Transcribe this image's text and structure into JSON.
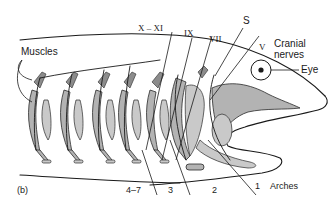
{
  "figure": {
    "panel_label": "(b)",
    "labels": {
      "muscles": "Muscles",
      "cranial_nerves_line1": "Cranial",
      "cranial_nerves_line2": "nerves",
      "eye": "Eye",
      "arches": "Arches"
    },
    "nerves": [
      {
        "id": "X-XI",
        "label": "X – XI"
      },
      {
        "id": "IX",
        "label": "IX"
      },
      {
        "id": "VII",
        "label": "VII"
      },
      {
        "id": "S",
        "label": "S"
      },
      {
        "id": "V",
        "label": "V"
      }
    ],
    "arch_numbers": [
      {
        "id": "4-7",
        "label": "4–7"
      },
      {
        "id": "3",
        "label": "3"
      },
      {
        "id": "2",
        "label": "2"
      },
      {
        "id": "1",
        "label": "1"
      }
    ],
    "colors": {
      "arch_fill": "#b3b3b3",
      "muscle_fill": "#8c8c8c",
      "line": "#1a1a1a",
      "background": "#ffffff"
    }
  }
}
